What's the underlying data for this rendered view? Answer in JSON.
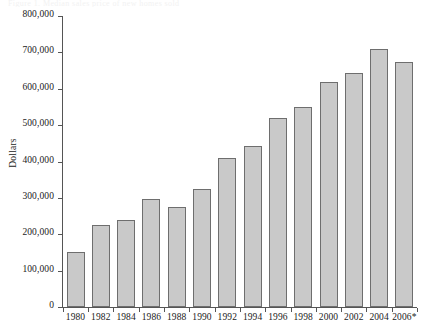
{
  "caption_remnant": "Figure 1. Median sales price of new homes sold",
  "chart_data": {
    "type": "bar",
    "title": "",
    "subtitle": "",
    "xlabel": "",
    "ylabel": "Dollars",
    "categories": [
      "1980",
      "1982",
      "1984",
      "1986",
      "1988",
      "1990",
      "1992",
      "1994",
      "1996",
      "1998",
      "2000",
      "2002",
      "2004",
      "2006*"
    ],
    "values": [
      152000,
      226000,
      240000,
      297000,
      275000,
      325000,
      409000,
      442000,
      519000,
      549000,
      618000,
      644000,
      710000,
      674000
    ],
    "ylim": [
      0,
      800000
    ],
    "ytick_values": [
      0,
      100000,
      200000,
      300000,
      400000,
      500000,
      600000,
      700000,
      800000
    ],
    "ytick_labels": [
      "0",
      "100,000",
      "200,000",
      "300,000",
      "400,000",
      "500,000",
      "600,000",
      "700,000",
      "800,000"
    ],
    "grid": false,
    "legend": null,
    "legend_position": "none",
    "bar_color": "#c9c9c9",
    "bar_border_color": "#6e6e6e",
    "axis_color": "#555555",
    "text_color": "#1a1a1a",
    "footnote_marker": "*"
  }
}
